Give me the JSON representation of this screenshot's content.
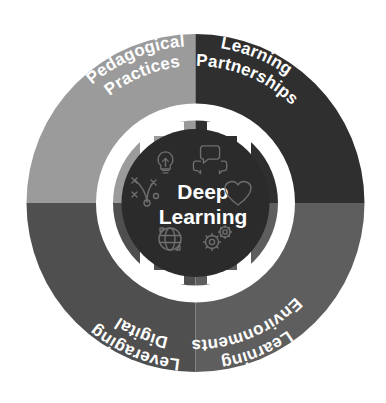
{
  "diagram": {
    "center": {
      "line1": "Deep",
      "line2": "Learning",
      "background_color": "#2b2b2b",
      "text_color": "#ffffff"
    },
    "ring": {
      "color": "#ffffff",
      "arrow_count": 4,
      "arrow_direction": "outward-clockwise"
    },
    "background_color": "#ffffff",
    "quadrants": [
      {
        "id": "pedagogical-practices",
        "position": "top-left",
        "line1": "Pedagogical",
        "line2": "Practices",
        "color": "#9b9b9b",
        "text_color": "#ffffff"
      },
      {
        "id": "learning-partnerships",
        "position": "top-right",
        "line1": "Learning",
        "line2": "Partnerships",
        "color": "#2f2f2f",
        "text_color": "#ffffff"
      },
      {
        "id": "leveraging-digital",
        "position": "bottom-left",
        "line1": "Leveraging",
        "line2": "Digital",
        "color": "#4f4f4f",
        "text_color": "#ffffff"
      },
      {
        "id": "learning-environments",
        "position": "bottom-right",
        "line1": "Learning",
        "line2": "Environments",
        "color": "#5e5e5e",
        "text_color": "#ffffff"
      }
    ],
    "icons": [
      {
        "id": "lightbulb-icon",
        "label": "lightbulb",
        "position": "top-left"
      },
      {
        "id": "speech-bubbles-icon",
        "label": "speech-bubbles",
        "position": "top-right"
      },
      {
        "id": "heart-icon",
        "label": "heart",
        "position": "right"
      },
      {
        "id": "strategy-diagram-icon",
        "label": "strategy-diagram",
        "position": "left"
      },
      {
        "id": "globe-icon",
        "label": "globe",
        "position": "bottom-left"
      },
      {
        "id": "gears-icon",
        "label": "gears",
        "position": "bottom-right"
      }
    ]
  }
}
